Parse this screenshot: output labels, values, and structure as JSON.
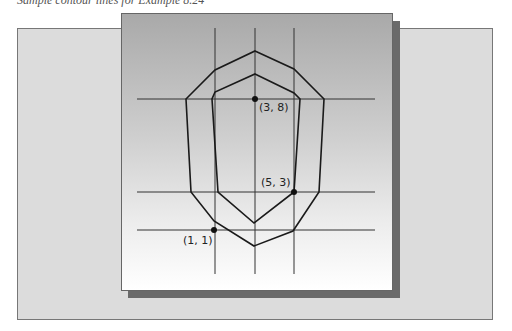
{
  "caption": "Sample contour lines for Example 8.24",
  "colors": {
    "back_panel": "#dcdcdc",
    "front_panel_top": "#a9a9a9",
    "front_panel_bottom": "#ffffff",
    "shadow": "#6a6a6a",
    "lines": "#222222"
  },
  "grid": {
    "vertical_x": [
      215,
      255,
      294
    ],
    "horizontal_y": [
      99,
      192,
      230
    ]
  },
  "contours": {
    "outer": "outer-contour",
    "inner": "inner-contour"
  },
  "points": [
    {
      "label": "(3, 8)",
      "x": 3,
      "y": 8
    },
    {
      "label": "(5, 3)",
      "x": 5,
      "y": 3
    },
    {
      "label": "(1, 1)",
      "x": 1,
      "y": 1
    }
  ]
}
